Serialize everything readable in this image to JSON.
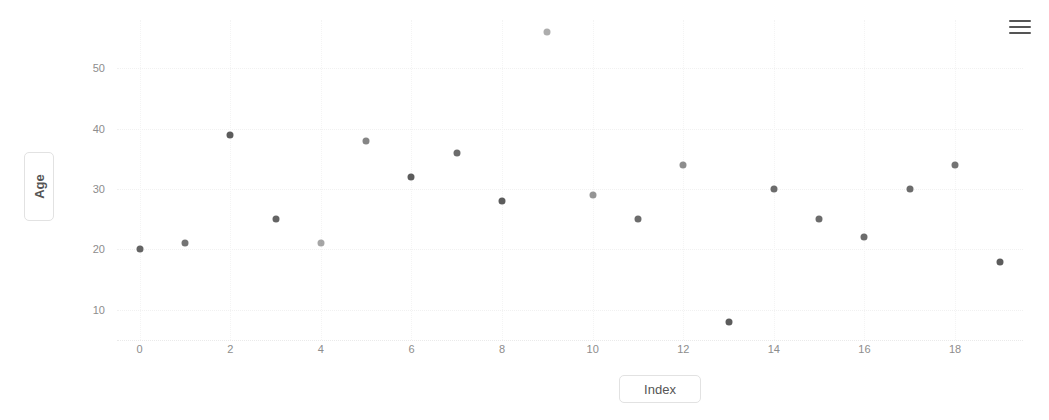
{
  "menu": {
    "icon": "hamburger-menu-icon",
    "label": "Chart context menu"
  },
  "axis_title_y": "Age",
  "axis_title_x": "Index",
  "colors": {
    "marker": "#5c5c5c",
    "tick_text": "#8d8d8d",
    "grid": "#f1f1f1",
    "axis_title": "#555555",
    "background": "#ffffff"
  },
  "chart_data": {
    "type": "scatter",
    "title": "",
    "subtitle": "",
    "xlabel": "Index",
    "ylabel": "Age",
    "xlim": [
      -0.5,
      19.5
    ],
    "ylim": [
      5,
      58
    ],
    "grid": true,
    "legend": false,
    "legend_position": "none",
    "xticks": [
      0,
      2,
      4,
      6,
      8,
      10,
      12,
      14,
      16,
      18
    ],
    "yticks": [
      10,
      20,
      30,
      40,
      50
    ],
    "x": [
      0,
      1,
      2,
      3,
      4,
      5,
      6,
      7,
      8,
      9,
      10,
      11,
      12,
      13,
      14,
      15,
      16,
      17,
      18,
      19
    ],
    "y": [
      20,
      21,
      39,
      25,
      21,
      38,
      32,
      36,
      28,
      56,
      29,
      25,
      34,
      8,
      30,
      25,
      22,
      30,
      34,
      18
    ],
    "series": [
      {
        "name": "Age",
        "values": [
          20,
          21,
          39,
          25,
          21,
          38,
          32,
          36,
          28,
          56,
          29,
          25,
          34,
          8,
          30,
          25,
          22,
          30,
          34,
          18
        ]
      }
    ]
  }
}
